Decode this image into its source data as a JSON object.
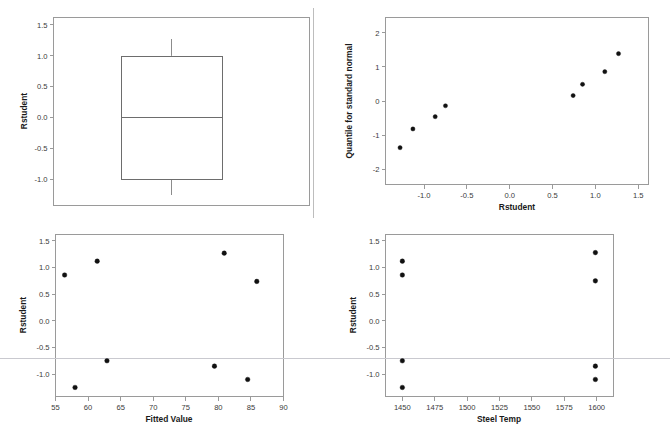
{
  "figure": {
    "name": "regression-diagnostics-panel",
    "panel_count": 4,
    "background_color": "#ffffff",
    "point_color": "#111111",
    "frame_color": "#9a9a9a",
    "reference_line_color": "#c9c9cf"
  },
  "chart_data": [
    {
      "id": "boxplot-rstudent",
      "type": "box",
      "title": "",
      "xlabel": "",
      "ylabel": "Rstudent",
      "ylim": [
        -1.42,
        1.62
      ],
      "yticks": [
        -1.0,
        -0.5,
        0.0,
        0.5,
        1.0,
        1.5
      ],
      "yticklabels": [
        "-1.0",
        "-0.5",
        "0.0",
        "0.5",
        "1.0",
        "1.5"
      ],
      "grid": false,
      "legend": "none",
      "boxes": [
        {
          "label": "Rstudent",
          "whisker_low": -1.25,
          "q1": -1.0,
          "median": 0.0,
          "q3": 1.0,
          "whisker_high": 1.27
        }
      ]
    },
    {
      "id": "qq-plot-rstudent",
      "type": "scatter",
      "title": "",
      "xlabel": "Rstudent",
      "ylabel": "Quantile for standard normal",
      "xlim": [
        -1.45,
        1.62
      ],
      "ylim": [
        -2.45,
        2.45
      ],
      "xticks": [
        -1.0,
        -0.5,
        0.0,
        0.5,
        1.0,
        1.5
      ],
      "xticklabels": [
        "-1.0",
        "-0.5",
        "0.0",
        "0.5",
        "1.0",
        "1.5"
      ],
      "yticks": [
        -2,
        -1,
        0,
        1,
        2
      ],
      "yticklabels": [
        "-2",
        "-1",
        "0",
        "1",
        "2"
      ],
      "grid": false,
      "legend": "none",
      "x": [
        -1.28,
        -1.13,
        -0.87,
        -0.75,
        0.74,
        0.85,
        1.11,
        1.27
      ],
      "y": [
        -1.37,
        -0.82,
        -0.46,
        -0.14,
        0.16,
        0.49,
        0.86,
        1.39
      ]
    },
    {
      "id": "residual-vs-fitted",
      "type": "scatter",
      "title": "",
      "xlabel": "Fitted Value",
      "ylabel": "Rstudent",
      "xlim": [
        55,
        90
      ],
      "ylim": [
        -1.42,
        1.62
      ],
      "xticks": [
        55,
        60,
        65,
        70,
        75,
        80,
        85,
        90
      ],
      "xticklabels": [
        "55",
        "60",
        "65",
        "70",
        "75",
        "80",
        "85",
        "90"
      ],
      "yticks": [
        -1.0,
        -0.5,
        0.0,
        0.5,
        1.0,
        1.5
      ],
      "yticklabels": [
        "-1.0",
        "-0.5",
        "0.0",
        "0.5",
        "1.0",
        "1.5"
      ],
      "grid": false,
      "legend": "none",
      "reference_lines": [
        {
          "orientation": "horizontal",
          "value": -0.7
        }
      ],
      "x": [
        56.4,
        61.4,
        62.9,
        58.0,
        80.9,
        85.9,
        79.4,
        84.5
      ],
      "y": [
        0.86,
        1.12,
        -0.75,
        -1.25,
        1.27,
        0.74,
        -0.85,
        -1.1
      ]
    },
    {
      "id": "residual-vs-steel-temp",
      "type": "scatter",
      "title": "",
      "xlabel": "Steel Temp",
      "ylabel": "Rstudent",
      "xlim": [
        1437,
        1613
      ],
      "ylim": [
        -1.42,
        1.62
      ],
      "xticks": [
        1450,
        1475,
        1500,
        1525,
        1550,
        1575,
        1600
      ],
      "xticklabels": [
        "1450",
        "1475",
        "1500",
        "1525",
        "1550",
        "1575",
        "1600"
      ],
      "yticks": [
        -1.0,
        -0.5,
        0.0,
        0.5,
        1.0,
        1.5
      ],
      "yticklabels": [
        "-1.0",
        "-0.5",
        "0.0",
        "0.5",
        "1.0",
        "1.5"
      ],
      "grid": false,
      "legend": "none",
      "reference_lines": [
        {
          "orientation": "horizontal",
          "value": -0.7
        }
      ],
      "x": [
        1450,
        1450,
        1450,
        1450,
        1599,
        1599,
        1599,
        1599
      ],
      "y": [
        1.12,
        0.86,
        -0.75,
        -1.25,
        1.28,
        0.75,
        -0.85,
        -1.1
      ]
    }
  ]
}
